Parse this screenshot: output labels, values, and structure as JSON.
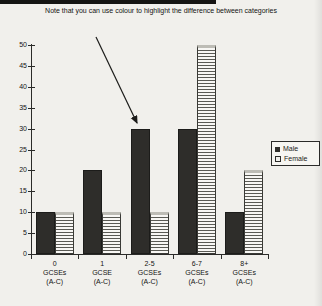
{
  "note": "Note that you can use colour to highlight the difference between categories",
  "colors": {
    "background": "#f1f0ec",
    "male_bar": "#2e2d2a",
    "female_bar_base": "#f8f7f4",
    "axis": "#2b2b29",
    "text": "#141412"
  },
  "chart_data": {
    "type": "bar",
    "title": "",
    "xlabel": "",
    "ylabel": "",
    "categories": [
      [
        "0",
        "GCSEs",
        "(A-C)"
      ],
      [
        "1",
        "GCSE",
        "(A-C)"
      ],
      [
        "2-5",
        "GCSEs",
        "(A-C)"
      ],
      [
        "6-7",
        "GCSEs",
        "(A-C)"
      ],
      [
        "8+",
        "GCSEs",
        "(A-C)"
      ]
    ],
    "series": [
      {
        "name": "Male",
        "style": "solid",
        "color": "#2e2d2a",
        "values": [
          10,
          20,
          30,
          30,
          10
        ]
      },
      {
        "name": "Female",
        "style": "hstripes",
        "color": "#f8f7f4",
        "values": [
          10,
          10,
          10,
          50,
          20
        ]
      }
    ],
    "ylim": [
      0,
      50
    ],
    "ytick_step": 5,
    "yticks": [
      0,
      5,
      10,
      15,
      20,
      25,
      30,
      35,
      40,
      45,
      50
    ],
    "grid": false,
    "legend_position": "right",
    "annotation": {
      "arrow_points_to": "Male bar of 2-5 GCSEs (value 30)"
    }
  }
}
